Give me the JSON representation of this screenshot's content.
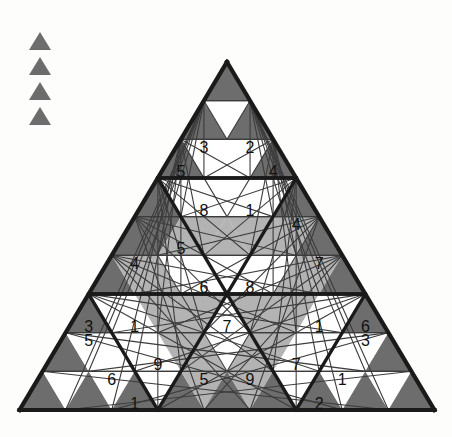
{
  "palette": {
    "background": "#fdfdfb",
    "dark_gray": "#6d6d6d",
    "light_gray": "#b3b3b3",
    "white": "#ffffff",
    "line": "#1a1a1a",
    "thin_line": "#3c3c3c",
    "text": "#111111"
  },
  "legend": {
    "name": "triangle-legend",
    "count": 4,
    "icon": "triangle-up-icon",
    "color": "#6d6d6d",
    "items": [
      {
        "label": ""
      },
      {
        "label": ""
      },
      {
        "label": ""
      },
      {
        "label": ""
      }
    ]
  },
  "puzzle": {
    "title": "",
    "type": "triangular-sudoku-grid",
    "rows": 9,
    "apex": {
      "x": 227,
      "y": 62
    },
    "bottom_left": {
      "x": 20,
      "y": 410
    },
    "bottom_right": {
      "x": 435,
      "y": 410
    },
    "grid": [
      {
        "row": 1,
        "cells": [
          {
            "i": 0,
            "dir": "up",
            "fill": "dark",
            "value": ""
          }
        ]
      },
      {
        "row": 2,
        "cells": [
          {
            "i": 0,
            "dir": "up",
            "fill": "dark",
            "value": ""
          },
          {
            "i": 1,
            "dir": "down",
            "fill": "white",
            "value": ""
          },
          {
            "i": 2,
            "dir": "up",
            "fill": "dark",
            "value": ""
          }
        ]
      },
      {
        "row": 3,
        "cells": [
          {
            "i": 0,
            "dir": "up",
            "fill": "dark",
            "value": "5"
          },
          {
            "i": 1,
            "dir": "down",
            "fill": "white",
            "value": "3"
          },
          {
            "i": 2,
            "dir": "up",
            "fill": "white",
            "value": ""
          },
          {
            "i": 3,
            "dir": "down",
            "fill": "white",
            "value": "2"
          },
          {
            "i": 4,
            "dir": "up",
            "fill": "dark",
            "value": "4"
          }
        ]
      },
      {
        "row": 4,
        "cells": [
          {
            "i": 0,
            "dir": "up",
            "fill": "dark",
            "value": ""
          },
          {
            "i": 1,
            "dir": "down",
            "fill": "white",
            "value": ""
          },
          {
            "i": 2,
            "dir": "up",
            "fill": "white",
            "value": "8"
          },
          {
            "i": 3,
            "dir": "down",
            "fill": "white",
            "value": ""
          },
          {
            "i": 4,
            "dir": "up",
            "fill": "white",
            "value": "1"
          },
          {
            "i": 5,
            "dir": "down",
            "fill": "white",
            "value": ""
          },
          {
            "i": 6,
            "dir": "up",
            "fill": "dark",
            "value": ""
          }
        ]
      },
      {
        "row": 5,
        "cells": [
          {
            "i": 0,
            "dir": "up",
            "fill": "dark",
            "value": ""
          },
          {
            "i": 1,
            "dir": "down",
            "fill": "dark",
            "value": ""
          },
          {
            "i": 2,
            "dir": "up",
            "fill": "light",
            "value": "5"
          },
          {
            "i": 3,
            "dir": "down",
            "fill": "light",
            "value": ""
          },
          {
            "i": 4,
            "dir": "up",
            "fill": "light",
            "value": ""
          },
          {
            "i": 5,
            "dir": "down",
            "fill": "light",
            "value": ""
          },
          {
            "i": 6,
            "dir": "up",
            "fill": "light",
            "value": ""
          },
          {
            "i": 7,
            "dir": "down",
            "fill": "light",
            "value": "4"
          },
          {
            "i": 8,
            "dir": "up",
            "fill": "dark",
            "value": ""
          }
        ]
      },
      {
        "row": 6,
        "cells": [
          {
            "i": 0,
            "dir": "up",
            "fill": "dark",
            "value": ""
          },
          {
            "i": 1,
            "dir": "down",
            "fill": "light",
            "value": "4"
          },
          {
            "i": 2,
            "dir": "up",
            "fill": "light",
            "value": ""
          },
          {
            "i": 3,
            "dir": "down",
            "fill": "white",
            "value": ""
          },
          {
            "i": 4,
            "dir": "up",
            "fill": "white",
            "value": "6"
          },
          {
            "i": 5,
            "dir": "down",
            "fill": "white",
            "value": ""
          },
          {
            "i": 6,
            "dir": "up",
            "fill": "white",
            "value": "8"
          },
          {
            "i": 7,
            "dir": "down",
            "fill": "white",
            "value": ""
          },
          {
            "i": 8,
            "dir": "up",
            "fill": "light",
            "value": ""
          },
          {
            "i": 9,
            "dir": "down",
            "fill": "light",
            "value": "7"
          },
          {
            "i": 10,
            "dir": "up",
            "fill": "dark",
            "value": ""
          }
        ]
      },
      {
        "row": 7,
        "cells": [
          {
            "i": 0,
            "dir": "up",
            "fill": "dark",
            "value": "3"
          },
          {
            "i": 1,
            "dir": "down",
            "fill": "white",
            "value": ""
          },
          {
            "i": 2,
            "dir": "up",
            "fill": "white",
            "value": "1"
          },
          {
            "i": 3,
            "dir": "down",
            "fill": "light",
            "value": ""
          },
          {
            "i": 4,
            "dir": "up",
            "fill": "light",
            "value": ""
          },
          {
            "i": 5,
            "dir": "down",
            "fill": "light",
            "value": ""
          },
          {
            "i": 6,
            "dir": "up",
            "fill": "white",
            "value": "7"
          },
          {
            "i": 7,
            "dir": "down",
            "fill": "light",
            "value": ""
          },
          {
            "i": 8,
            "dir": "up",
            "fill": "light",
            "value": ""
          },
          {
            "i": 9,
            "dir": "down",
            "fill": "light",
            "value": ""
          },
          {
            "i": 10,
            "dir": "up",
            "fill": "white",
            "value": "1"
          },
          {
            "i": 11,
            "dir": "down",
            "fill": "white",
            "value": ""
          },
          {
            "i": 12,
            "dir": "up",
            "fill": "dark",
            "value": "6"
          }
        ]
      },
      {
        "row": 8,
        "cells": [
          {
            "i": 0,
            "dir": "up",
            "fill": "dark",
            "value": ""
          },
          {
            "i": 1,
            "dir": "down",
            "fill": "white",
            "value": "5"
          },
          {
            "i": 2,
            "dir": "up",
            "fill": "white",
            "value": ""
          },
          {
            "i": 3,
            "dir": "down",
            "fill": "white",
            "value": ""
          },
          {
            "i": 4,
            "dir": "up",
            "fill": "white",
            "value": "9"
          },
          {
            "i": 5,
            "dir": "down",
            "fill": "light",
            "value": ""
          },
          {
            "i": 6,
            "dir": "up",
            "fill": "light",
            "value": ""
          },
          {
            "i": 7,
            "dir": "down",
            "fill": "white",
            "value": ""
          },
          {
            "i": 8,
            "dir": "up",
            "fill": "light",
            "value": ""
          },
          {
            "i": 9,
            "dir": "down",
            "fill": "light",
            "value": ""
          },
          {
            "i": 10,
            "dir": "up",
            "fill": "white",
            "value": "7"
          },
          {
            "i": 11,
            "dir": "down",
            "fill": "white",
            "value": ""
          },
          {
            "i": 12,
            "dir": "up",
            "fill": "white",
            "value": ""
          },
          {
            "i": 13,
            "dir": "down",
            "fill": "white",
            "value": "3"
          },
          {
            "i": 14,
            "dir": "up",
            "fill": "dark",
            "value": ""
          }
        ]
      },
      {
        "row": 9,
        "cells": [
          {
            "i": 0,
            "dir": "up",
            "fill": "dark",
            "value": ""
          },
          {
            "i": 1,
            "dir": "down",
            "fill": "white",
            "value": ""
          },
          {
            "i": 2,
            "dir": "up",
            "fill": "dark",
            "value": ""
          },
          {
            "i": 3,
            "dir": "down",
            "fill": "white",
            "value": "6"
          },
          {
            "i": 4,
            "dir": "up",
            "fill": "dark",
            "value": "1"
          },
          {
            "i": 5,
            "dir": "down",
            "fill": "white",
            "value": ""
          },
          {
            "i": 6,
            "dir": "up",
            "fill": "dark",
            "value": ""
          },
          {
            "i": 7,
            "dir": "down",
            "fill": "light",
            "value": "5"
          },
          {
            "i": 8,
            "dir": "up",
            "fill": "dark",
            "value": ""
          },
          {
            "i": 9,
            "dir": "down",
            "fill": "light",
            "value": "9"
          },
          {
            "i": 10,
            "dir": "up",
            "fill": "dark",
            "value": ""
          },
          {
            "i": 11,
            "dir": "down",
            "fill": "white",
            "value": ""
          },
          {
            "i": 12,
            "dir": "up",
            "fill": "dark",
            "value": "2"
          },
          {
            "i": 13,
            "dir": "down",
            "fill": "white",
            "value": "1"
          },
          {
            "i": 14,
            "dir": "up",
            "fill": "dark",
            "value": ""
          },
          {
            "i": 15,
            "dir": "down",
            "fill": "white",
            "value": ""
          },
          {
            "i": 16,
            "dir": "up",
            "fill": "dark",
            "value": ""
          }
        ]
      }
    ],
    "regions": [
      {
        "name": "region-top",
        "apexRow": 0,
        "apexCol": 0,
        "size": 3
      },
      {
        "name": "region-upper-mid",
        "apexRow": 3,
        "apexCol": 0,
        "size": 3
      },
      {
        "name": "region-left-mid",
        "apexRow": 3,
        "apexCol": 0,
        "size": 3
      },
      {
        "name": "region-lower-left",
        "apexRow": 6,
        "apexCol": 0,
        "size": 3
      },
      {
        "name": "region-lower-center",
        "apexRow": 6,
        "apexCol": 1,
        "size": 3
      },
      {
        "name": "region-lower-right",
        "apexRow": 6,
        "apexCol": 2,
        "size": 3
      }
    ]
  }
}
